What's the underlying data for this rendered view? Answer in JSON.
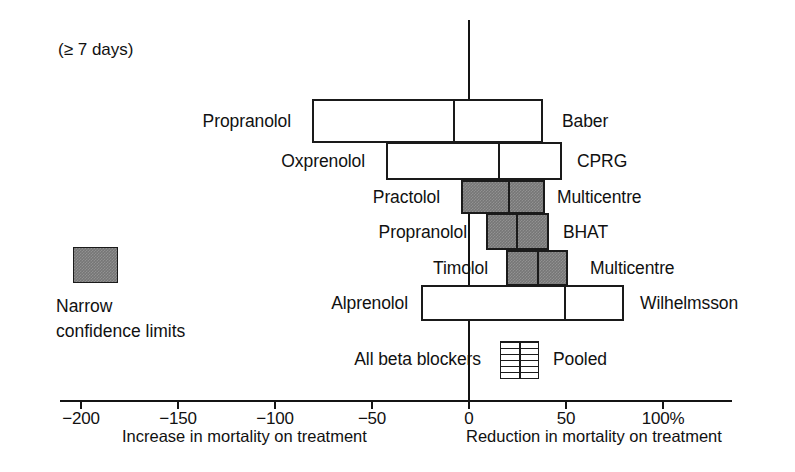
{
  "figure": {
    "duration_note": "(≥ 7 days)",
    "pooled_row_label": "All beta blockers",
    "pooled_label": "Pooled"
  },
  "legend": {
    "swatch_name": "narrow-confidence-limits-swatch",
    "line1": "Narrow",
    "line2": "confidence limits"
  },
  "axis": {
    "left_caption": "Increase in mortality on treatment",
    "right_caption": "Reduction in mortality on treatment",
    "tick_labels": [
      "−200",
      "−150",
      "−100",
      "−50",
      "0",
      "50",
      "100%"
    ],
    "tick_values": [
      -200,
      -150,
      -100,
      -50,
      0,
      50,
      100
    ]
  },
  "chart_data": {
    "type": "bar",
    "title": "",
    "subtitle": "(≥ 7 days)",
    "xlabel": "Percentage change in mortality on treatment",
    "ylabel": "",
    "xlim": [
      -205,
      105
    ],
    "grid": false,
    "legend_position": "left-middle",
    "orientation": "horizontal",
    "categories": [
      "Propranolol",
      "Oxprenolol",
      "Practolol",
      "Propranolol",
      "Timolol",
      "Alprenolol",
      "All beta blockers"
    ],
    "trials": [
      {
        "drug": "Propranolol",
        "study": "Baber",
        "ci_low": -81,
        "ci_high": 38,
        "estimate": -8,
        "narrow": false
      },
      {
        "drug": "Oxprenolol",
        "study": "CPRG",
        "ci_low": -43,
        "ci_high": 48,
        "estimate": 15,
        "narrow": false
      },
      {
        "drug": "Practolol",
        "study": "Multicentre",
        "ci_low": -4,
        "ci_high": 39,
        "estimate": 20,
        "narrow": true
      },
      {
        "drug": "Propranolol",
        "study": "BHAT",
        "ci_low": 9,
        "ci_high": 41,
        "estimate": 24,
        "narrow": true
      },
      {
        "drug": "Timolol",
        "study": "Multicentre",
        "ci_low": 19,
        "ci_high": 51,
        "estimate": 35,
        "narrow": true
      },
      {
        "drug": "Alprenolol",
        "study": "Wilhelmsson",
        "ci_low": -25,
        "ci_high": 80,
        "estimate": 49,
        "narrow": false
      }
    ],
    "pooled": {
      "drug": "All beta blockers",
      "study": "Pooled",
      "ci_low": 16,
      "ci_high": 35,
      "estimate": 25,
      "style": "striped"
    }
  }
}
